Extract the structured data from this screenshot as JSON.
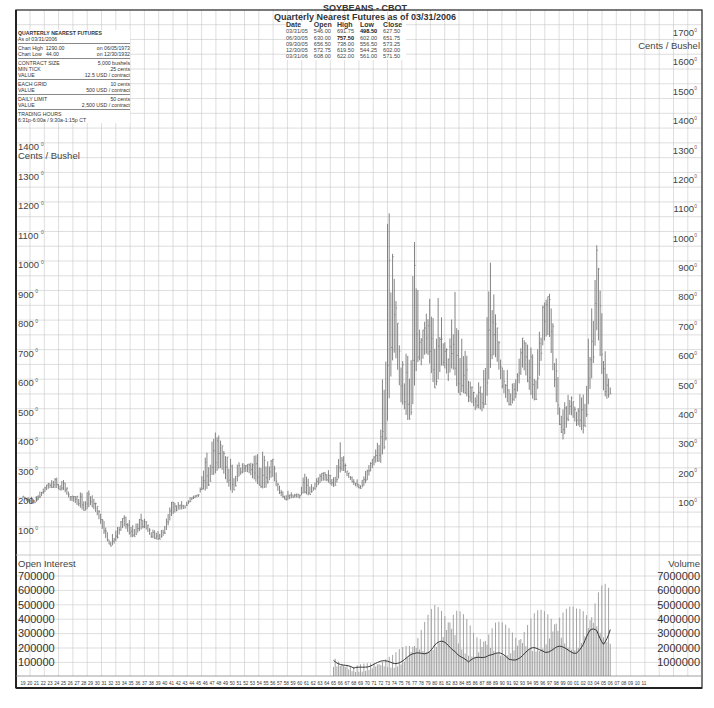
{
  "title": {
    "line1": "SOYBEANS - CBOT",
    "line2": "Quarterly Nearest Futures as of 03/31/2006"
  },
  "info": {
    "heading": "QUARTERLY NEAREST FUTURES",
    "as_of": "As of 03/31/2006",
    "chart_high_label": "Chart High",
    "chart_high_value": "1290.00",
    "chart_high_date": "on  06/05/1973",
    "chart_low_label": "Chart Low",
    "chart_low_value": "44.00",
    "chart_low_date": "on  12/30/1932",
    "contract_size_label": "CONTRACT SIZE",
    "contract_size_value": "5,000 bushels",
    "min_tick_label": "MIN TICK",
    "min_tick_value": ".25 cents",
    "min_tick_value_label": "VALUE",
    "min_tick_usd": "12.5 USD / contract",
    "each_grid_label": "EACH GRID",
    "each_grid_value": "10 cents",
    "each_grid_value_label": "VALUE",
    "each_grid_usd": "500 USD / contract",
    "daily_limit_label": "DAILY LIMIT",
    "daily_limit_value": "50 cents",
    "daily_limit_value_label": "VALUE",
    "daily_limit_usd": "2,500 USD / contract",
    "trading_hours_label": "TRADING HOURS",
    "trading_hours_value": "6:31p-6:00a  /  9:30a-1:15p CT"
  },
  "quarterly_table": {
    "headers": [
      "Date",
      "Open",
      "High",
      "Low",
      "Close"
    ],
    "rows": [
      [
        "03/31/05",
        "546.00",
        "691.75",
        "498.50",
        "627.50"
      ],
      [
        "06/30/05",
        "630.00",
        "757.50",
        "602.00",
        "651.75"
      ],
      [
        "09/30/05",
        "656.50",
        "738.00",
        "556.50",
        "573.25"
      ],
      [
        "12/30/05",
        "572.75",
        "619.50",
        "544.25",
        "602.00"
      ],
      [
        "03/31/06",
        "608.00",
        "622.00",
        "561.00",
        "571.50"
      ]
    ],
    "bold_cells": [
      [
        0,
        3
      ],
      [
        1,
        2
      ]
    ]
  },
  "axes": {
    "price_unit_left": "Cents / Bushel",
    "price_unit_right": "Cents / Bushel",
    "left_price_ticks": [
      "1400",
      "1300",
      "1200",
      "1100",
      "1000",
      "900",
      "800",
      "700",
      "600",
      "500",
      "400",
      "300",
      "200",
      "100"
    ],
    "right_price_ticks": [
      "1700",
      "1600",
      "1500",
      "1400",
      "1300",
      "1200",
      "1100",
      "1000",
      "900",
      "800",
      "700",
      "600",
      "500",
      "400",
      "300",
      "200",
      "100"
    ],
    "open_interest_label": "Open Interest",
    "open_interest_ticks": [
      "700000",
      "600000",
      "500000",
      "400000",
      "300000",
      "200000",
      "100000"
    ],
    "volume_label": "Volume",
    "volume_ticks": [
      "7000000",
      "6000000",
      "5000000",
      "4000000",
      "3000000",
      "2000000",
      "1000000"
    ],
    "x_ticks": [
      "19",
      "20",
      "21",
      "22",
      "23",
      "24",
      "25",
      "26",
      "27",
      "28",
      "29",
      "30",
      "31",
      "32",
      "33",
      "34",
      "35",
      "36",
      "37",
      "38",
      "39",
      "40",
      "41",
      "42",
      "43",
      "44",
      "45",
      "46",
      "47",
      "48",
      "49",
      "50",
      "51",
      "52",
      "53",
      "54",
      "55",
      "56",
      "57",
      "58",
      "59",
      "60",
      "61",
      "62",
      "63",
      "64",
      "65",
      "66",
      "67",
      "68",
      "69",
      "70",
      "71",
      "72",
      "73",
      "74",
      "75",
      "76",
      "77",
      "78",
      "79",
      "80",
      "81",
      "82",
      "83",
      "84",
      "85",
      "86",
      "87",
      "88",
      "89",
      "90",
      "91",
      "92",
      "93",
      "94",
      "95",
      "96",
      "97",
      "98",
      "99",
      "00",
      "01",
      "02",
      "03",
      "04",
      "05",
      "06",
      "07",
      "08",
      "09",
      "10",
      "11"
    ]
  },
  "colors": {
    "grid": "#c8c8c8",
    "bars": "#777777",
    "frame": "#333333",
    "oi_line": "#333333",
    "volume_bars": "#9a9a9a"
  },
  "chart_data": {
    "type": "bar",
    "subtype": "ohlc-quarterly-with-volume-open-interest",
    "title": "SOYBEANS - CBOT  Quarterly Nearest Futures as of 03/31/2006",
    "xlabel": "Year",
    "ylabel": "Cents / Bushel",
    "ylim_left": [
      0,
      1400
    ],
    "ylim_right": [
      0,
      1700
    ],
    "grid": true,
    "legend": null,
    "x_range": [
      "1919",
      "2011"
    ],
    "chart_high": {
      "value": 1290.0,
      "date": "06/05/1973"
    },
    "chart_low": {
      "value": 44.0,
      "date": "12/30/1932"
    },
    "price_series": {
      "name": "Soybeans quarterly high/low (cents/bushel, approx.)",
      "points": [
        {
          "year": 1919,
          "low": 200,
          "high": 215
        },
        {
          "year": 1920,
          "low": 185,
          "high": 210
        },
        {
          "year": 1921,
          "low": 195,
          "high": 220
        },
        {
          "year": 1922,
          "low": 210,
          "high": 240
        },
        {
          "year": 1923,
          "low": 225,
          "high": 265
        },
        {
          "year": 1924,
          "low": 240,
          "high": 280
        },
        {
          "year": 1925,
          "low": 230,
          "high": 275
        },
        {
          "year": 1926,
          "low": 185,
          "high": 215
        },
        {
          "year": 1927,
          "low": 170,
          "high": 215
        },
        {
          "year": 1928,
          "low": 165,
          "high": 245
        },
        {
          "year": 1929,
          "low": 170,
          "high": 230
        },
        {
          "year": 1930,
          "low": 120,
          "high": 180
        },
        {
          "year": 1931,
          "low": 75,
          "high": 130
        },
        {
          "year": 1932,
          "low": 44,
          "high": 80
        },
        {
          "year": 1933,
          "low": 50,
          "high": 110
        },
        {
          "year": 1934,
          "low": 80,
          "high": 150
        },
        {
          "year": 1935,
          "low": 70,
          "high": 130
        },
        {
          "year": 1936,
          "low": 85,
          "high": 170
        },
        {
          "year": 1937,
          "low": 80,
          "high": 140
        },
        {
          "year": 1938,
          "low": 60,
          "high": 95
        },
        {
          "year": 1939,
          "low": 65,
          "high": 120
        },
        {
          "year": 1940,
          "low": 80,
          "high": 120
        },
        {
          "year": 1941,
          "low": 100,
          "high": 195
        },
        {
          "year": 1942,
          "low": 160,
          "high": 195
        },
        {
          "year": 1943,
          "low": 175,
          "high": 200
        },
        {
          "year": 1944,
          "low": 195,
          "high": 215
        },
        {
          "year": 1945,
          "low": 205,
          "high": 220
        },
        {
          "year": 1946,
          "low": 215,
          "high": 345
        },
        {
          "year": 1947,
          "low": 280,
          "high": 440
        },
        {
          "year": 1948,
          "low": 230,
          "high": 420
        },
        {
          "year": 1949,
          "low": 215,
          "high": 350
        },
        {
          "year": 1950,
          "low": 220,
          "high": 340
        },
        {
          "year": 1951,
          "low": 275,
          "high": 330
        },
        {
          "year": 1952,
          "low": 275,
          "high": 320
        },
        {
          "year": 1953,
          "low": 250,
          "high": 330
        },
        {
          "year": 1954,
          "low": 250,
          "high": 415
        },
        {
          "year": 1955,
          "low": 215,
          "high": 330
        },
        {
          "year": 1956,
          "low": 220,
          "high": 340
        },
        {
          "year": 1957,
          "low": 215,
          "high": 250
        },
        {
          "year": 1958,
          "low": 200,
          "high": 235
        },
        {
          "year": 1959,
          "low": 200,
          "high": 225
        },
        {
          "year": 1960,
          "low": 195,
          "high": 220
        },
        {
          "year": 1961,
          "low": 210,
          "high": 335
        },
        {
          "year": 1962,
          "low": 230,
          "high": 260
        },
        {
          "year": 1963,
          "low": 235,
          "high": 290
        },
        {
          "year": 1964,
          "low": 245,
          "high": 300
        },
        {
          "year": 1965,
          "low": 245,
          "high": 310
        },
        {
          "year": 1966,
          "low": 270,
          "high": 400
        },
        {
          "year": 1967,
          "low": 265,
          "high": 300
        },
        {
          "year": 1968,
          "low": 245,
          "high": 275
        },
        {
          "year": 1969,
          "low": 240,
          "high": 270
        },
        {
          "year": 1970,
          "low": 250,
          "high": 310
        },
        {
          "year": 1971,
          "low": 290,
          "high": 350
        },
        {
          "year": 1972,
          "low": 310,
          "high": 440
        },
        {
          "year": 1973,
          "low": 430,
          "high": 1290
        },
        {
          "year": 1974,
          "low": 520,
          "high": 950
        },
        {
          "year": 1975,
          "low": 450,
          "high": 650
        },
        {
          "year": 1976,
          "low": 460,
          "high": 760
        },
        {
          "year": 1977,
          "low": 510,
          "high": 1075
        },
        {
          "year": 1978,
          "low": 570,
          "high": 750
        },
        {
          "year": 1979,
          "low": 620,
          "high": 860
        },
        {
          "year": 1980,
          "low": 580,
          "high": 950
        },
        {
          "year": 1981,
          "low": 600,
          "high": 820
        },
        {
          "year": 1982,
          "low": 530,
          "high": 680
        },
        {
          "year": 1983,
          "low": 550,
          "high": 955
        },
        {
          "year": 1984,
          "low": 560,
          "high": 900
        },
        {
          "year": 1985,
          "low": 480,
          "high": 620
        },
        {
          "year": 1986,
          "low": 470,
          "high": 550
        },
        {
          "year": 1987,
          "low": 490,
          "high": 650
        },
        {
          "year": 1988,
          "low": 560,
          "high": 1100
        },
        {
          "year": 1989,
          "low": 560,
          "high": 830
        },
        {
          "year": 1990,
          "low": 540,
          "high": 650
        },
        {
          "year": 1991,
          "low": 520,
          "high": 640
        },
        {
          "year": 1992,
          "low": 530,
          "high": 610
        },
        {
          "year": 1993,
          "low": 550,
          "high": 750
        },
        {
          "year": 1994,
          "low": 530,
          "high": 720
        },
        {
          "year": 1995,
          "low": 540,
          "high": 710
        },
        {
          "year": 1996,
          "low": 660,
          "high": 860
        },
        {
          "year": 1997,
          "low": 620,
          "high": 900
        },
        {
          "year": 1998,
          "low": 510,
          "high": 700
        },
        {
          "year": 1999,
          "low": 400,
          "high": 520
        },
        {
          "year": 2000,
          "low": 430,
          "high": 570
        },
        {
          "year": 2001,
          "low": 420,
          "high": 500
        },
        {
          "year": 2002,
          "low": 420,
          "high": 620
        },
        {
          "year": 2003,
          "low": 540,
          "high": 790
        },
        {
          "year": 2004,
          "low": 500,
          "high": 1064
        },
        {
          "year": 2005,
          "low": 498,
          "high": 757
        },
        {
          "year": 2006,
          "low": 561,
          "high": 622
        }
      ]
    },
    "volume_series": {
      "name": "Volume (quarterly, approx.)",
      "x": [
        1965,
        1968,
        1971,
        1974,
        1977,
        1980,
        1983,
        1986,
        1989,
        1992,
        1995,
        1998,
        2001,
        2003,
        2004,
        2005,
        2006
      ],
      "values": [
        1200000,
        600000,
        900000,
        1300000,
        2500000,
        4200000,
        4500000,
        2500000,
        3300000,
        2800000,
        3800000,
        4300000,
        4000000,
        4600000,
        5500000,
        5600000,
        5000000
      ]
    },
    "open_interest_series": {
      "name": "Open Interest (quarterly, approx.)",
      "x": [
        1965,
        1968,
        1971,
        1974,
        1977,
        1980,
        1983,
        1985,
        1988,
        1991,
        1993,
        1996,
        1999,
        2001,
        2002,
        2003,
        2004,
        2005,
        2006
      ],
      "values": [
        120000,
        50000,
        90000,
        100000,
        140000,
        220000,
        200000,
        90000,
        170000,
        120000,
        150000,
        200000,
        180000,
        190000,
        220000,
        280000,
        310000,
        260000,
        350000
      ]
    }
  }
}
